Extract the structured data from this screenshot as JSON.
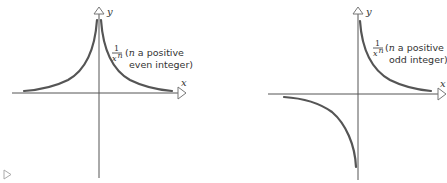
{
  "diagram": {
    "left_graph": {
      "x_axis_label": "x",
      "y_axis_label": "y",
      "function_numerator": "1",
      "function_denominator": "x",
      "function_exponent": "n",
      "annotation_var": "n",
      "annotation_line1": " a positive",
      "annotation_line2": "even integer)",
      "annotation_open": "("
    },
    "right_graph": {
      "x_axis_label": "x",
      "y_axis_label": "y",
      "function_numerator": "1",
      "function_denominator": "x",
      "function_exponent": "n",
      "annotation_var": "n",
      "annotation_line1": " a positive",
      "annotation_line2": "odd integer)",
      "annotation_open": "("
    },
    "colors": {
      "curve": "#555555",
      "axis": "#555555",
      "text": "#333333"
    }
  }
}
